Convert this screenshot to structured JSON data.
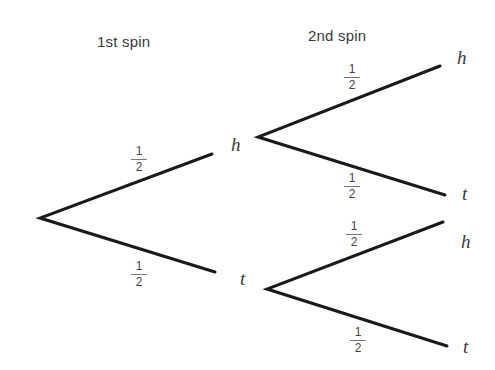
{
  "headers": {
    "first": "1st spin",
    "second": "2nd spin"
  },
  "nodes": {
    "first_h": "h",
    "first_t": "t",
    "second_hh": "h",
    "second_ht": "t",
    "second_th": "h",
    "second_tt": "t"
  },
  "probabilities": [
    {
      "num": "1",
      "den": "2"
    },
    {
      "num": "1",
      "den": "2"
    },
    {
      "num": "1",
      "den": "2"
    },
    {
      "num": "1",
      "den": "2"
    },
    {
      "num": "1",
      "den": "2"
    },
    {
      "num": "1",
      "den": "2"
    }
  ],
  "colors": {
    "line": "#1a1a1a",
    "text": "#3a3a3a"
  }
}
